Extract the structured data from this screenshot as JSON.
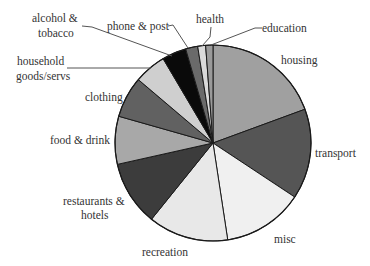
{
  "chart_data": {
    "type": "pie",
    "title": "",
    "start": "top",
    "direction": "clockwise",
    "unit": "percent",
    "slices": [
      {
        "label": "housing",
        "value": 19.4,
        "color": "#a0a0a0"
      },
      {
        "label": "transport",
        "value": 14.9,
        "color": "#555555"
      },
      {
        "label": "misc",
        "value": 13.3,
        "color": "#f0f0f0"
      },
      {
        "label": "recreation",
        "value": 13.2,
        "color": "#e8e8e8"
      },
      {
        "label": "restaurants & hotels",
        "value": 10.7,
        "color": "#3c3c3c"
      },
      {
        "label": "food & drink",
        "value": 7.9,
        "color": "#a8a8a8"
      },
      {
        "label": "clothing",
        "value": 6.8,
        "color": "#616161"
      },
      {
        "label": "household goods/servs",
        "value": 5.3,
        "color": "#cfcfcf"
      },
      {
        "label": "alcohol & tobacco",
        "value": 4.0,
        "color": "#0a0a0a"
      },
      {
        "label": "phone & post",
        "value": 2.0,
        "color": "#6a6a6a"
      },
      {
        "label": "health",
        "value": 1.3,
        "color": "#dadada"
      },
      {
        "label": "education",
        "value": 1.2,
        "color": "#9a9a9a"
      }
    ],
    "labels": {
      "housing": [
        "housing"
      ],
      "transport": [
        "transport"
      ],
      "misc": [
        "misc"
      ],
      "recreation": [
        "recreation"
      ],
      "restaurants": [
        "restaurants &",
        "hotels"
      ],
      "food": [
        "food & drink"
      ],
      "clothing": [
        "clothing"
      ],
      "household": [
        "household",
        "goods/servs"
      ],
      "alcohol": [
        "alcohol &",
        "tobacco"
      ],
      "phone": [
        "phone & post"
      ],
      "health": [
        "health"
      ],
      "education": [
        "education"
      ]
    }
  }
}
